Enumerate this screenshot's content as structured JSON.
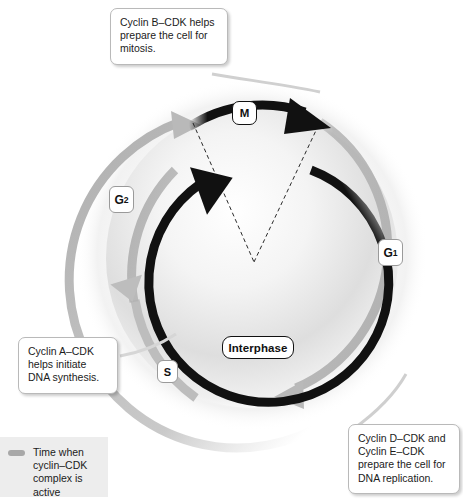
{
  "diagram": {
    "center_label": "Interphase",
    "phases": [
      {
        "id": "m",
        "label": "M",
        "sub": ""
      },
      {
        "id": "g1",
        "label": "G",
        "sub": "1"
      },
      {
        "id": "s",
        "label": "S",
        "sub": ""
      },
      {
        "id": "g2",
        "label": "G",
        "sub": "2"
      }
    ],
    "callouts": [
      {
        "id": "cyclin-b",
        "text": "Cyclin B–CDK helps prepare the cell for mitosis."
      },
      {
        "id": "cyclin-a",
        "text": "Cyclin A–CDK helps initiate DNA synthesis."
      },
      {
        "id": "cyclin-de",
        "text": "Cyclin D–CDK and Cyclin E–CDK prepare the cell for DNA replication."
      }
    ],
    "legend": {
      "swatch_color": "#a8a8a8",
      "text": "Time when cyclin–CDK complex is active"
    },
    "colors": {
      "arc_black": "#111111",
      "arc_gray": "#b0b0b0",
      "callout_border": "#b9b9b9",
      "legend_background": "#ededed",
      "background": "#ffffff"
    }
  }
}
